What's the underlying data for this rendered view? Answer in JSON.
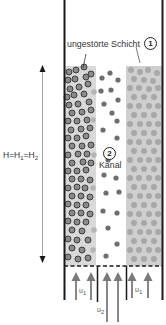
{
  "labels": {
    "undisturbed_layer": "ungestörte Schicht",
    "undisturbed_layer_number": "1",
    "channel": "Kanal",
    "channel_number": "2",
    "height_equation_main": "H=H",
    "height_equation_sub1": "1",
    "height_equation_mid": "=H",
    "height_equation_sub2": "2",
    "velocity_outer_main": "u",
    "velocity_outer_sub": "1",
    "velocity_inner_main": "u",
    "velocity_inner_sub": "2"
  },
  "colors": {
    "wall": "#1a1a1a",
    "left_band_bg": "#d9d9d9",
    "right_band_bg": "#cfcfcf",
    "dark_particle_fill": "#8a8a8a",
    "dark_particle_stroke": "#333333",
    "light_particle": "#a8a8a8",
    "channel_particle": "#6e6e6e",
    "arrow": "#7a7a7a"
  }
}
